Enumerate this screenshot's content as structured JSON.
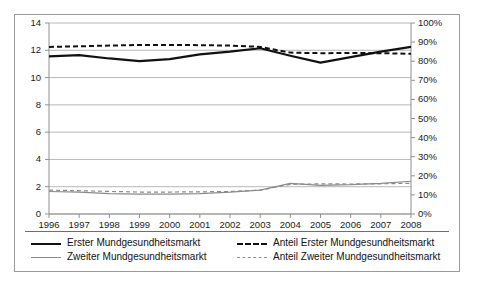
{
  "chart_data": {
    "type": "line",
    "title": "",
    "subtitle": "",
    "xlabel": "",
    "ylabel": "",
    "y2label": "",
    "grid": true,
    "legend_position": "bottom",
    "categories": [
      "1996",
      "1997",
      "1998",
      "1999",
      "2000",
      "2001",
      "2002",
      "2003",
      "2004",
      "2005",
      "2006",
      "2007",
      "2008"
    ],
    "ylim": [
      0,
      14
    ],
    "yticks": [
      "0",
      "2",
      "4",
      "6",
      "8",
      "10",
      "12",
      "14"
    ],
    "y2lim": [
      0,
      100
    ],
    "y2ticks": [
      "0%",
      "10%",
      "20%",
      "30%",
      "40%",
      "50%",
      "60%",
      "70%",
      "80%",
      "90%",
      "100%"
    ],
    "series": [
      {
        "name": "Erster Mundgesundheitsmarkt",
        "axis": "left",
        "style": "solid",
        "color": "#111111",
        "width": 2.2,
        "values": [
          11.55,
          11.65,
          11.4,
          11.2,
          11.35,
          11.7,
          11.9,
          12.15,
          11.6,
          11.1,
          11.5,
          11.9,
          12.25
        ]
      },
      {
        "name": "Zweiter Mundgesundheitsmarkt",
        "axis": "left",
        "style": "solid",
        "color": "#8a8a8a",
        "width": 1.2,
        "values": [
          1.65,
          1.6,
          1.5,
          1.45,
          1.45,
          1.5,
          1.6,
          1.75,
          2.25,
          2.1,
          2.15,
          2.25,
          2.4
        ]
      },
      {
        "name": "Anteil Erster Mundgesundheitsmarkt",
        "axis": "right",
        "style": "dashed",
        "color": "#111111",
        "width": 2.0,
        "values": [
          87.5,
          87.8,
          88.2,
          88.5,
          88.5,
          88.4,
          88.2,
          87.5,
          84.5,
          84.2,
          84.3,
          84.2,
          83.9
        ]
      },
      {
        "name": "Anteil Zweiter Mundgesundheitsmarkt",
        "axis": "right",
        "style": "dashed",
        "color": "#8a8a8a",
        "width": 1.2,
        "values": [
          12.5,
          12.2,
          11.8,
          11.5,
          11.5,
          11.6,
          11.8,
          12.5,
          15.5,
          15.8,
          15.7,
          15.8,
          16.1
        ]
      }
    ]
  },
  "legend": {
    "items": [
      {
        "label": "Erster Mundgesundheitsmarkt",
        "swatch": "solid-dark"
      },
      {
        "label": "Zweiter Mundgesundheitsmarkt",
        "swatch": "solid-gray"
      },
      {
        "label": "Anteil Erster Mundgesundheitsmarkt",
        "swatch": "dash-dark"
      },
      {
        "label": "Anteil Zweiter Mundgesundheitsmarkt",
        "swatch": "dash-gray"
      }
    ]
  },
  "colors": {
    "primary": "#111111",
    "secondary": "#8a8a8a",
    "grid": "#b8b8b8",
    "frame": "#9a9a9a",
    "background": "#ffffff"
  }
}
